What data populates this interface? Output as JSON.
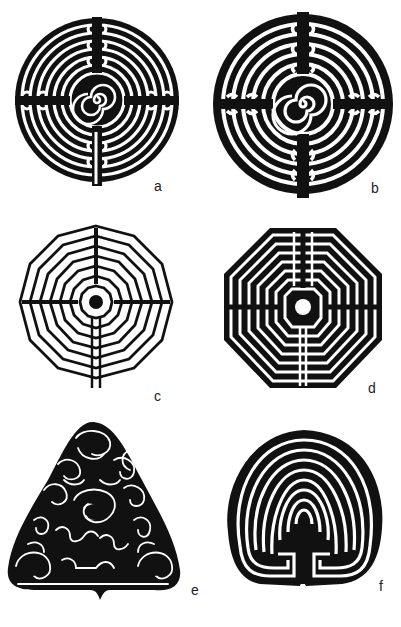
{
  "page": {
    "header_text": "",
    "background": "#ffffff",
    "ink_color": "#111111"
  },
  "figures": [
    {
      "id": "a",
      "label": "a",
      "shape": "circle",
      "center": "spiral",
      "description": "circular labyrinth with spiral center"
    },
    {
      "id": "b",
      "label": "b",
      "shape": "circle",
      "center": "spiral",
      "description": "circular labyrinth, heavy black, spiral center"
    },
    {
      "id": "c",
      "label": "c",
      "shape": "dodecagon",
      "center": "dot",
      "description": "twelve-sided labyrinth, white paths"
    },
    {
      "id": "d",
      "label": "d",
      "shape": "octagon",
      "center": "white-circle",
      "description": "octagonal labyrinth"
    },
    {
      "id": "e",
      "label": "e",
      "shape": "rounded-triangle",
      "center": "three-circles",
      "description": "irregular meandering labyrinth"
    },
    {
      "id": "f",
      "label": "f",
      "shape": "horseshoe",
      "center": "cretan",
      "description": "classical Cretan-style labyrinth"
    }
  ]
}
